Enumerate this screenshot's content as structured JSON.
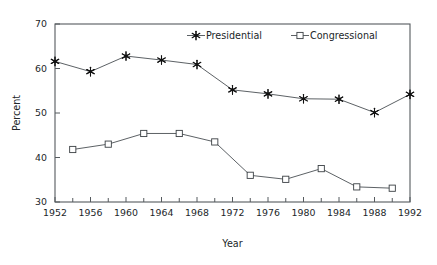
{
  "chart_data": {
    "type": "line",
    "title": "",
    "xlabel": "Year",
    "ylabel": "Percent",
    "xlim": [
      1952,
      1992
    ],
    "ylim": [
      30,
      70
    ],
    "ytick_labels": [
      "30",
      "40",
      "50",
      "60",
      "70"
    ],
    "yticks": [
      30,
      40,
      50,
      60,
      70
    ],
    "xtick_labels": [
      "1952",
      "1956",
      "1960",
      "1964",
      "1968",
      "1972",
      "1976",
      "1980",
      "1984",
      "1988",
      "1992"
    ],
    "xticks": [
      1952,
      1956,
      1960,
      1964,
      1968,
      1972,
      1976,
      1980,
      1984,
      1988,
      1992
    ],
    "xminor_ticks": [
      1954,
      1958,
      1962,
      1966,
      1970,
      1974,
      1978,
      1982,
      1986,
      1990
    ],
    "grid": false,
    "legend_position": "top-center",
    "series": [
      {
        "name": "Presidential",
        "marker": "star",
        "x": [
          1952,
          1956,
          1960,
          1964,
          1968,
          1972,
          1976,
          1980,
          1984,
          1988,
          1992
        ],
        "values": [
          61.6,
          59.3,
          62.8,
          61.9,
          60.9,
          55.2,
          54.3,
          53.2,
          53.1,
          50.1,
          54.2
        ]
      },
      {
        "name": "Congressional",
        "marker": "square",
        "x": [
          1954,
          1958,
          1962,
          1966,
          1970,
          1974,
          1978,
          1982,
          1986,
          1990
        ],
        "values": [
          41.8,
          43.0,
          45.4,
          45.4,
          43.5,
          36.0,
          35.1,
          37.5,
          33.4,
          33.1
        ]
      }
    ]
  },
  "legend": {
    "items": [
      {
        "label": "Presidential",
        "marker": "star"
      },
      {
        "label": "Congressional",
        "marker": "square"
      }
    ]
  },
  "axes": {
    "x_title": "Year",
    "y_title": "Percent"
  }
}
